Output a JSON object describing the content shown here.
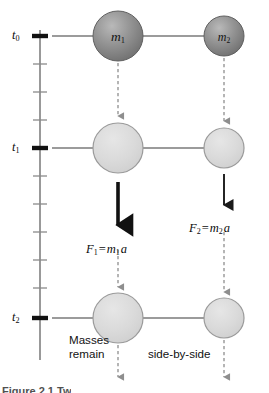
{
  "figure": {
    "type": "physics-spacetime-diagram",
    "caption_partial": "Figure 2.1   Tw",
    "background": "#ffffff"
  },
  "axis": {
    "name": "time-axis",
    "orientation": "vertical",
    "line_color": "#6e6e6e",
    "major_tick_color": "#111111",
    "minor_tick_color": "#8a8a8a",
    "major_labels": [
      {
        "id": "t0",
        "text": "t",
        "subscript": "0",
        "y": 36
      },
      {
        "id": "t1",
        "text": "t",
        "subscript": "1",
        "y": 148
      },
      {
        "id": "t2",
        "text": "t",
        "subscript": "2",
        "y": 318
      }
    ],
    "minor_tick_ys": [
      64,
      92,
      120,
      176,
      204,
      232,
      260,
      288
    ],
    "top_y": 30,
    "bottom_y": 360
  },
  "masses": [
    {
      "id": "m1-t0",
      "label": "m",
      "subscript": "1",
      "row": "t0",
      "shade": "dark",
      "cx": 118,
      "cy": 36,
      "r": 25,
      "fill": "#808080"
    },
    {
      "id": "m2-t0",
      "label": "m",
      "subscript": "2",
      "row": "t0",
      "shade": "dark",
      "cx": 224,
      "cy": 36,
      "r": 20,
      "fill": "#808080"
    },
    {
      "id": "m1-t1",
      "label": "",
      "subscript": "",
      "row": "t1",
      "shade": "light",
      "cx": 118,
      "cy": 148,
      "r": 25,
      "fill": "#d6d6d6"
    },
    {
      "id": "m2-t1",
      "label": "",
      "subscript": "",
      "row": "t1",
      "shade": "light",
      "cx": 224,
      "cy": 148,
      "r": 20,
      "fill": "#d6d6d6"
    },
    {
      "id": "m1-t2",
      "label": "",
      "subscript": "",
      "row": "t2",
      "shade": "light",
      "cx": 118,
      "cy": 318,
      "r": 25,
      "fill": "#d6d6d6"
    },
    {
      "id": "m2-t2",
      "label": "",
      "subscript": "",
      "row": "t2",
      "shade": "light",
      "cx": 224,
      "cy": 318,
      "r": 20,
      "fill": "#d6d6d6"
    }
  ],
  "forces": [
    {
      "id": "F1",
      "symbol": "F",
      "subscript": "1",
      "equals": "=",
      "mass_symbol": "m",
      "mass_subscript": "1",
      "accel": "a",
      "full_text": "F1 = m1 a",
      "arrow_style": "thick-solid",
      "arrow_color": "#111111",
      "label_x": 86,
      "label_y": 243
    },
    {
      "id": "F2",
      "symbol": "F",
      "subscript": "2",
      "equals": "=",
      "mass_symbol": "m",
      "mass_subscript": "2",
      "accel": "a",
      "full_text": "F2 = m2 a",
      "arrow_style": "thin-solid",
      "arrow_color": "#1a1a1a",
      "label_x": 189,
      "label_y": 222
    }
  ],
  "notes": [
    {
      "id": "masses-remain",
      "line1": "Masses",
      "line2": "remain",
      "x": 69,
      "y": 333
    },
    {
      "id": "side-by-side",
      "line1": "side-by-side",
      "line2": "",
      "x": 148,
      "y": 347
    }
  ],
  "dashed_arrows": {
    "color": "#8e8e8e",
    "description": "vertical dashed worldline arrows connecting successive mass positions"
  },
  "connectors": {
    "color": "#7a7a7a",
    "description": "horizontal lines linking the time axis tick to mass 1 and mass 1 to mass 2"
  }
}
